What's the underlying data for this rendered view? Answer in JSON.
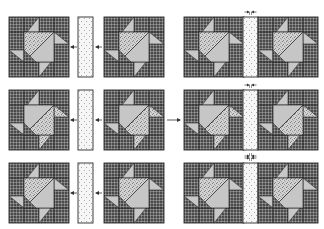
{
  "diagram": {
    "colors": {
      "background": "#ffffff",
      "dark_fabric": "#6e6e6e",
      "dark_fabric_hatch": "#3c3c3c",
      "speckled_fabric": "#c9c9c9",
      "speckled_dots": "#8a8a8a",
      "light_fabric": "#c4c4c4",
      "sashing_fabric": "#f4f4f4",
      "sashing_dots": "#9a9a9a",
      "seam_line": "#2a2a2a",
      "arrow": "#333333"
    },
    "rows": [
      {
        "label": "Row 1",
        "layout": "block + sashing + block",
        "left_block_variant": "pinwheel-A",
        "right_block_variant": "pinwheel-A",
        "arrows": [
          "left-arrow-to-block",
          "left-arrow-to-strip"
        ],
        "result": "joined row with seam-press arrows on top"
      },
      {
        "label": "Row 2",
        "layout": "block + sashing + block",
        "left_block_variant": "pinwheel-B",
        "right_block_variant": "pinwheel-B",
        "arrows": [
          "left-arrow-to-block",
          "left-arrow-to-strip",
          "right-arrow-to-result"
        ],
        "result": "joined row with seam-press arrows on top and bottom"
      },
      {
        "label": "Row 3",
        "layout": "block + sashing + block",
        "left_block_variant": "pinwheel-A",
        "right_block_variant": "pinwheel-A",
        "arrows": [
          "left-arrow-to-block",
          "left-arrow-to-strip"
        ],
        "result": "joined row with seam-press arrows on top"
      }
    ]
  }
}
